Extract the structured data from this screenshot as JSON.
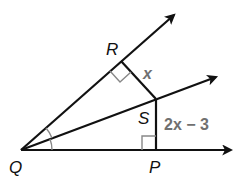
{
  "diagram": {
    "vertices": {
      "Q": {
        "label": "Q",
        "x": 21,
        "y": 150
      },
      "R": {
        "label": "R",
        "x": 121,
        "y": 61
      },
      "S": {
        "label": "S",
        "x": 156,
        "y": 99
      },
      "P": {
        "label": "P",
        "x": 156,
        "y": 150
      }
    },
    "rays": [
      {
        "name": "QR",
        "from": "Q",
        "through": "R"
      },
      {
        "name": "QS",
        "from": "Q",
        "through": "S"
      },
      {
        "name": "QP",
        "from": "Q",
        "through": "P"
      }
    ],
    "segments": [
      {
        "name": "RS",
        "label": "x"
      },
      {
        "name": "SP",
        "label": "2x − 3"
      }
    ],
    "right_angles": [
      "QRS",
      "QPS"
    ],
    "congruent_angles": [
      "RQS",
      "SQP"
    ],
    "labels": {
      "RS": "x",
      "SP": "2x − 3"
    },
    "colors": {
      "lines": "#111111",
      "marks": "#888888",
      "measure_text": "#707070"
    }
  }
}
